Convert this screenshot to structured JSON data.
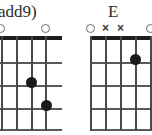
{
  "image": {
    "width": 152,
    "height": 135,
    "background": "#ffffff",
    "content_type": "guitar-chord-diagrams",
    "count": 2
  },
  "colors": {
    "nut": "#1d1d1d",
    "fret_line": "#5a5a5a",
    "string_line": "#4a4a4a",
    "finger_dot": "#1a1a1a",
    "open_marker": "#6b6b6b",
    "mute_marker": "#3a3a3a",
    "label_text": "#2b2b2b"
  },
  "chords": [
    {
      "id": "chord-left",
      "label": "add9)",
      "label_note": "name truncated at left image edge",
      "label_left": -2,
      "label_top": 1,
      "cropped_edge": "left",
      "grid": {
        "left": -14,
        "top": 36,
        "width": 76,
        "height": 96,
        "strings": 6,
        "frets": 4,
        "string_spacing": 15.2,
        "fret_spacing": 23
      },
      "markers": [
        {
          "string": 1,
          "type": "none"
        },
        {
          "string": 2,
          "type": "none"
        },
        {
          "string": 3,
          "type": "none"
        },
        {
          "string": 4,
          "type": "open",
          "symbol": "O"
        },
        {
          "string": 5,
          "type": "none"
        },
        {
          "string": 6,
          "type": "open",
          "symbol": "O"
        }
      ],
      "marker_positions": [
        {
          "left": -4,
          "symbol": "",
          "type": "open"
        },
        {
          "left": 41,
          "symbol": "",
          "type": "open"
        }
      ],
      "dots": [
        {
          "string": 4,
          "fret": 2,
          "left": 26,
          "top": 77
        },
        {
          "string": 5,
          "fret": 3,
          "left": 41,
          "top": 100
        }
      ]
    },
    {
      "id": "chord-right",
      "label": "E",
      "label_left": 108,
      "label_top": 1,
      "cropped_edge": "right",
      "grid": {
        "left": 90,
        "top": 36,
        "width": 76,
        "height": 96,
        "strings": 6,
        "frets": 4,
        "string_spacing": 15.2,
        "fret_spacing": 23
      },
      "markers": [
        {
          "string": 1,
          "type": "open",
          "symbol": "O"
        },
        {
          "string": 2,
          "type": "mute",
          "symbol": "×"
        },
        {
          "string": 3,
          "type": "mute",
          "symbol": "×"
        },
        {
          "string": 4,
          "type": "none"
        },
        {
          "string": 5,
          "type": "open",
          "symbol": "O"
        },
        {
          "string": 6,
          "type": "none"
        }
      ],
      "marker_positions": [
        {
          "left": 86,
          "symbol": "",
          "type": "open"
        },
        {
          "left": 101,
          "symbol": "×",
          "type": "mute"
        },
        {
          "left": 116,
          "symbol": "×",
          "type": "mute"
        },
        {
          "left": 146,
          "symbol": "",
          "type": "open"
        }
      ],
      "dots": [
        {
          "string": 4,
          "fret": 1,
          "left": 130,
          "top": 54
        }
      ]
    }
  ]
}
